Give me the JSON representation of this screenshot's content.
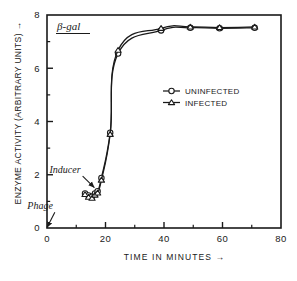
{
  "chart_data": {
    "type": "line",
    "title": "β-gal",
    "xlabel": "TIME  IN  MINUTES →",
    "ylabel": "ENZYME  ACTIVITY  (ARBITRARY  UNITS) →",
    "xlim": [
      0,
      80
    ],
    "ylim": [
      0,
      8
    ],
    "xticks": [
      0,
      20,
      40,
      60,
      80
    ],
    "xtick_labels": [
      "0",
      "20",
      "40",
      "60",
      "80"
    ],
    "x_minor_ticks": [
      10,
      30,
      50,
      70
    ],
    "yticks": [
      0,
      2,
      4,
      6,
      8
    ],
    "ytick_labels": [
      "0",
      "2",
      "4",
      "6",
      "8"
    ],
    "y_minor_ticks": [
      1,
      3,
      5,
      7
    ],
    "grid": false,
    "legend_position": "center-right",
    "series": [
      {
        "name": "UNINFECTED",
        "marker": "circle",
        "x": [
          13.0,
          14.2,
          15.4,
          16.4,
          17.3,
          18.6,
          21.6,
          24.3,
          39.0,
          49.0,
          59.0,
          71.0
        ],
        "y": [
          1.3,
          1.22,
          1.18,
          1.3,
          1.38,
          1.88,
          3.58,
          6.55,
          7.42,
          7.52,
          7.5,
          7.52
        ]
      },
      {
        "name": "INFECTED",
        "marker": "triangle",
        "x": [
          13.0,
          14.2,
          15.4,
          16.4,
          17.3,
          18.6,
          21.6,
          24.3,
          39.0,
          49.0,
          59.0,
          71.0
        ],
        "y": [
          1.26,
          1.16,
          1.12,
          1.24,
          1.32,
          1.8,
          3.52,
          6.68,
          7.5,
          7.55,
          7.53,
          7.55
        ]
      }
    ],
    "annotations": [
      {
        "text": "Inducer",
        "x": 11.5,
        "y": 2.08,
        "arrow_to_x": 16.2,
        "arrow_to_y": 1.52
      },
      {
        "text": "Phage",
        "x": 2.0,
        "y": 0.72,
        "arrow_to_x": 0.0,
        "arrow_to_y": 0.02
      }
    ]
  },
  "legend": {
    "entries": [
      {
        "label": "UNINFECTED",
        "marker": "circle"
      },
      {
        "label": "INFECTED",
        "marker": "triangle"
      }
    ]
  },
  "caption": {
    "text": ""
  }
}
